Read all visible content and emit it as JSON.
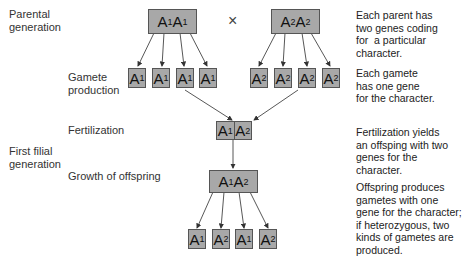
{
  "stages": {
    "parental": "Parental\ngeneration",
    "gamete_production": "Gamete\nproduction",
    "fertilization": "Fertilization",
    "first_filial": "First filial\ngeneration",
    "growth": "Growth of offspring"
  },
  "cross_symbol": "×",
  "parents": [
    {
      "allele1": "A",
      "sub1": "1",
      "allele2": "A",
      "sub2": "1"
    },
    {
      "allele1": "A",
      "sub1": "2",
      "allele2": "A",
      "sub2": "2"
    }
  ],
  "gametes_parent1": [
    {
      "allele": "A",
      "sub": "1"
    },
    {
      "allele": "A",
      "sub": "1"
    },
    {
      "allele": "A",
      "sub": "1"
    },
    {
      "allele": "A",
      "sub": "1"
    }
  ],
  "gametes_parent2": [
    {
      "allele": "A",
      "sub": "2"
    },
    {
      "allele": "A",
      "sub": "2"
    },
    {
      "allele": "A",
      "sub": "2"
    },
    {
      "allele": "A",
      "sub": "2"
    }
  ],
  "zygote": {
    "left_allele": "A",
    "left_sub": "1",
    "right_allele": "A",
    "right_sub": "2"
  },
  "offspring": {
    "allele1": "A",
    "sub1": "1",
    "allele2": "A",
    "sub2": "2"
  },
  "offspring_gametes": [
    {
      "allele": "A",
      "sub": "1"
    },
    {
      "allele": "A",
      "sub": "2"
    },
    {
      "allele": "A",
      "sub": "1"
    },
    {
      "allele": "A",
      "sub": "2"
    }
  ],
  "descriptions": {
    "parents": "Each parent has\ntwo genes coding\nfor  a particular\ncharacter.",
    "gametes": "Each gamete\nhas one gene\nfor the character.",
    "fertilization": "Fertilization yields\nan offsping with two\ngenes for the\ncharacter.",
    "offspring": "Offspring produces\ngametes with one\ngene for the character;\nif heterozygous, two\nkinds of gametes are\nproduced."
  },
  "colors": {
    "box_fill": "#a8a8a8",
    "box_border": "#555555",
    "arrow": "#444444"
  }
}
